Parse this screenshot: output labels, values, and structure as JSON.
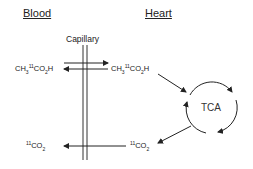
{
  "headers": {
    "blood": "Blood",
    "heart": "Heart"
  },
  "capillary_label": "Capillary",
  "left": {
    "acetate": {
      "pre": "CH",
      "sub1": "3",
      "sup": "11",
      "mid": "CO",
      "sub2": "2",
      "post": "H"
    },
    "co2": {
      "sup": "11",
      "mid": "CO",
      "sub": "2"
    }
  },
  "right": {
    "acetate": {
      "pre": "CH",
      "sub1": "3",
      "sup": "11",
      "mid": "CO",
      "sub2": "2",
      "post": "H"
    },
    "co2": {
      "sup": "11",
      "mid": "CO",
      "sub": "2"
    }
  },
  "cycle_label": "TCA",
  "colors": {
    "line": "#222222",
    "background": "#ffffff"
  }
}
